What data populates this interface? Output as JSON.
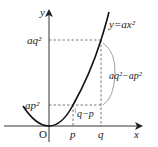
{
  "diagram": {
    "type": "function-graph",
    "curve_label": "y=ax²",
    "axes": {
      "x_label": "x",
      "y_label": "y",
      "origin_label": "O"
    },
    "x_ticks": [
      {
        "label": "p"
      },
      {
        "label": "q"
      }
    ],
    "y_ticks": [
      {
        "label": "ap²"
      },
      {
        "label": "aq²"
      }
    ],
    "annotations": {
      "horizontal_difference": "q−p",
      "vertical_difference": "aq²−ap²"
    },
    "colors": {
      "curve": "#111111",
      "axis": "#333333",
      "guide": "#555555",
      "brace": "#888888"
    }
  }
}
